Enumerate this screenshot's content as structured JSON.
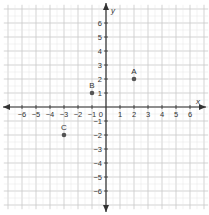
{
  "axes": {
    "x_label": "x",
    "y_label": "y",
    "x_ticks": [
      -6,
      -5,
      -4,
      -3,
      -2,
      -1,
      1,
      2,
      3,
      4,
      5,
      6
    ],
    "y_ticks": [
      6,
      5,
      4,
      3,
      2,
      1,
      -1,
      -2,
      -3,
      -4,
      -5,
      -6
    ],
    "origin_label": "0",
    "xlim": [
      -7,
      7
    ],
    "ylim": [
      -7,
      7
    ]
  },
  "points": [
    {
      "label": "A",
      "x": 2,
      "y": 2
    },
    {
      "label": "B",
      "x": -1,
      "y": 1
    },
    {
      "label": "C",
      "x": -3,
      "y": -2
    }
  ],
  "colors": {
    "grid": "#c8c8c8",
    "axis": "#333333",
    "point": "#555555"
  }
}
